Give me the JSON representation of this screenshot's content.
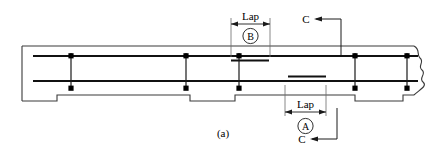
{
  "figure": {
    "caption": "(a)",
    "type": "reinforced-concrete-beam-elevation"
  },
  "colors": {
    "line": "#1a1a1a",
    "outline": "#3a3a3a",
    "rebar": "#111111",
    "background": "#ffffff"
  },
  "annotations": {
    "lap_top": {
      "label": "Lap",
      "bubble": "B"
    },
    "lap_bottom": {
      "label": "Lap",
      "bubble": "A"
    },
    "section_top": {
      "label": "C"
    },
    "section_bottom": {
      "label": "C"
    }
  },
  "beam": {
    "outline": {
      "left_x": 22,
      "right_x": 432,
      "top_y": 46,
      "bottom_y": 95
    },
    "notches": [
      {
        "start_x": 22,
        "end_x": 57,
        "depth_y": 101
      },
      {
        "start_x": 190,
        "end_x": 235,
        "depth_y": 101
      },
      {
        "start_x": 355,
        "end_x": 403,
        "depth_y": 101
      }
    ]
  },
  "rebar": {
    "top_main": {
      "x1": 33,
      "x2": 432,
      "y": 56
    },
    "bottom_main": {
      "x1": 33,
      "x2": 432,
      "y": 81
    },
    "top_lap": {
      "x1": 232,
      "x2": 268,
      "y": 60
    },
    "bottom_lap": {
      "x1": 290,
      "x2": 325,
      "y": 77
    }
  },
  "stirrups": {
    "x_positions": [
      71,
      186,
      239,
      355,
      407
    ],
    "top_y": 53,
    "bottom_y": 89
  },
  "dimension_lines": {
    "top_lap": {
      "left_x": 232,
      "right_x": 270,
      "y": 22,
      "ext_bottom_y": 56
    },
    "bottom_lap": {
      "left_x": 285,
      "right_x": 325,
      "y": 110,
      "ext_top_y": 85
    }
  },
  "leaders": {
    "section_top": {
      "arrow_x": 316,
      "arrow_y": 19,
      "corner_x": 340,
      "drop_y": 54
    },
    "section_bottom": {
      "arrow_x": 312,
      "arrow_y": 139,
      "corner_x": 336,
      "rise_y": 108
    }
  }
}
